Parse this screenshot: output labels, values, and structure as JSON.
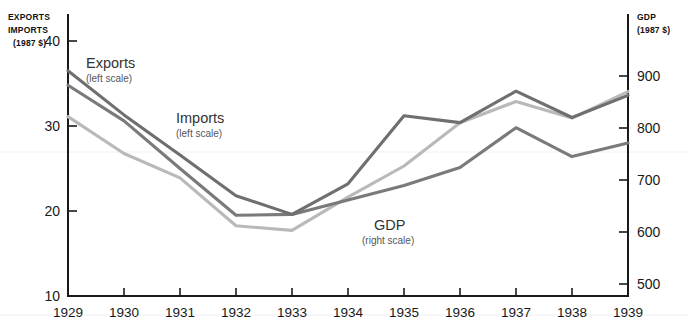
{
  "chart_data": {
    "type": "line",
    "title": "",
    "xlabel": "",
    "categories": [
      "1929",
      "1930",
      "1931",
      "1932",
      "1933",
      "1934",
      "1935",
      "1936",
      "1937",
      "1938",
      "1939"
    ],
    "left_axis": {
      "label_line1": "EXPORTS",
      "label_line2": "IMPORTS",
      "label_line3": "(1987 $)",
      "ticks": [
        "40",
        "30",
        "20",
        "10"
      ],
      "tick_values": [
        40,
        30,
        20,
        10
      ],
      "ylim": [
        10,
        40
      ]
    },
    "right_axis": {
      "label_line1": "GDP",
      "label_line2": "(1987 $)",
      "ticks": [
        "900",
        "800",
        "700",
        "600",
        "500"
      ],
      "tick_values": [
        900,
        800,
        700,
        600,
        500
      ],
      "ylim": [
        500,
        900
      ]
    },
    "grid": false,
    "legend_position": "inline-annotations",
    "series": [
      {
        "name": "Exports",
        "sublabel": "(left scale)",
        "axis": "left",
        "color": "#6f6f6f",
        "values": [
          36.5,
          31.3,
          26.6,
          21.8,
          19.6,
          23.2,
          31.2,
          30.4,
          34.1,
          31.0,
          33.6
        ]
      },
      {
        "name": "Imports",
        "sublabel": "(left scale)",
        "axis": "left",
        "color": "#7a7a7a",
        "values": [
          34.8,
          30.6,
          25.0,
          19.5,
          19.6,
          21.3,
          23.0,
          25.1,
          29.8,
          26.4,
          28.0
        ]
      },
      {
        "name": "GDP",
        "sublabel": "(right scale)",
        "axis": "right",
        "color": "#b9b9b9",
        "values": [
          822,
          751,
          704,
          612,
          603,
          667,
          727,
          810,
          851,
          819,
          870
        ]
      }
    ]
  },
  "annotations": {
    "exports": {
      "name": "Exports",
      "sub": "(left scale)"
    },
    "imports": {
      "name": "Imports",
      "sub": "(left scale)"
    },
    "gdp": {
      "name": "GDP",
      "sub": "(right scale)"
    }
  }
}
